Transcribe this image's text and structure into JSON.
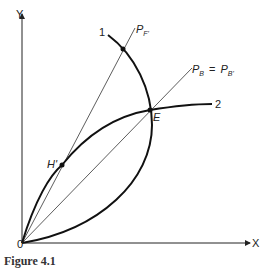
{
  "figure": {
    "caption": "Figure 4.1",
    "axes": {
      "y_label": "Y",
      "x_label": "X",
      "origin_label": "0"
    },
    "curves": [
      {
        "id": "1",
        "label": "1"
      },
      {
        "id": "2",
        "label": "2"
      }
    ],
    "rays": [
      {
        "id": "PF",
        "label_main": "P",
        "label_sub": "F'"
      },
      {
        "id": "PB",
        "label_main": "P",
        "label_sub": "B",
        "eq": "=",
        "label_main2": "P",
        "label_sub2": "B'"
      }
    ],
    "points": [
      {
        "id": "E",
        "label": "E"
      },
      {
        "id": "H",
        "label": "H'"
      }
    ],
    "colors": {
      "ink": "#1a1a1a",
      "background": "#ffffff"
    }
  }
}
